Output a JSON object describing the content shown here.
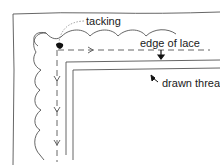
{
  "diagram": {
    "labels": {
      "tacking": "tacking",
      "edge_of_lace": "edge of lace",
      "drawn_threads": "drawn threads"
    },
    "colors": {
      "line": "#555555",
      "ink": "#1a1a1a",
      "background": "#ffffff"
    }
  }
}
